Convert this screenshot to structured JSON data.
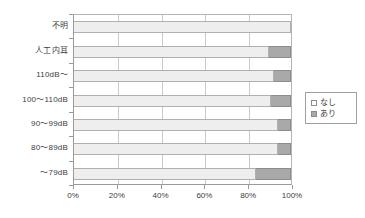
{
  "chart_data": {
    "type": "bar",
    "orientation": "horizontal",
    "stacked": true,
    "normalized": true,
    "title": "",
    "xlabel": "",
    "ylabel": "",
    "xlim": [
      0,
      100
    ],
    "xtick_labels": [
      "0%",
      "20%",
      "40%",
      "60%",
      "80%",
      "100%"
    ],
    "xtick_values": [
      0,
      20,
      40,
      60,
      80,
      100
    ],
    "grid": true,
    "grid_axis": "x",
    "legend_position": "right",
    "categories": [
      "不明",
      "人工内耳",
      "110dB～",
      "100～110dB",
      "90～99dB",
      "80～89dB",
      "～79dB"
    ],
    "series": [
      {
        "name": "なし",
        "color": "#eeeeee",
        "values": [
          100,
          90,
          92,
          91,
          94,
          94,
          84
        ]
      },
      {
        "name": "あり",
        "color": "#a9a9a9",
        "values": [
          0,
          10,
          8,
          9,
          6,
          6,
          16
        ]
      }
    ]
  },
  "legend": {
    "items": [
      {
        "label": "なし",
        "swatch": "nashi"
      },
      {
        "label": "あり",
        "swatch": "ari"
      }
    ]
  },
  "colors": {
    "nashi": "#eeeeee",
    "ari": "#a9a9a9",
    "axis": "#9a9a9a",
    "grid": "#c9c9c9",
    "text": "#3d3d3d"
  }
}
